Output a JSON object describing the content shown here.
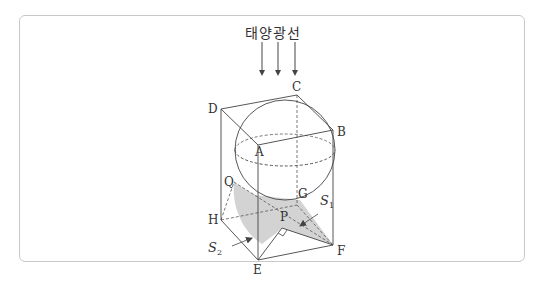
{
  "figure": {
    "title": "태양광선",
    "sunlight_arrows": 3,
    "vertices": {
      "A": "A",
      "B": "B",
      "C": "C",
      "D": "D",
      "E": "E",
      "F": "F",
      "G": "G",
      "H": "H"
    },
    "points": {
      "P": "P",
      "Q": "Q"
    },
    "regions": {
      "S1": {
        "letter": "S",
        "sub": "1"
      },
      "S2": {
        "letter": "S",
        "sub": "2"
      }
    },
    "colors": {
      "line": "#444444",
      "shadow": "#d3d3d3",
      "frame": "#c9c9c9"
    }
  }
}
